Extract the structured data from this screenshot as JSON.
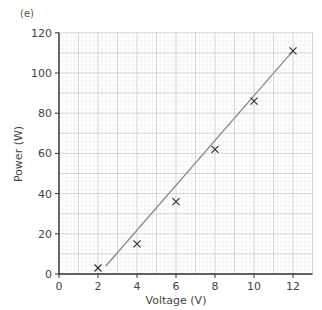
{
  "part_label": "(e)",
  "colors": {
    "axis": "#333333",
    "major_grid": "#c8c8c8",
    "minor_grid": "#ebebeb",
    "line": "#8a8a8a",
    "marker": "#333333"
  },
  "chart_data": {
    "type": "scatter",
    "title": "",
    "xlabel": "Voltage (V)",
    "ylabel": "Power (W)",
    "xlim": [
      0,
      13
    ],
    "ylim": [
      0,
      120
    ],
    "x_ticks": [
      0,
      2,
      4,
      6,
      8,
      10,
      12
    ],
    "y_ticks": [
      0,
      20,
      40,
      60,
      80,
      100,
      120
    ],
    "grid": true,
    "legend": null,
    "series": [
      {
        "name": "measured",
        "marker": "x",
        "x": [
          2,
          4,
          6,
          8,
          10,
          12
        ],
        "y": [
          3,
          15,
          36,
          62,
          86,
          111
        ]
      },
      {
        "name": "line of best fit",
        "type": "line",
        "x": [
          2.4,
          12
        ],
        "y": [
          4,
          111
        ]
      }
    ]
  }
}
